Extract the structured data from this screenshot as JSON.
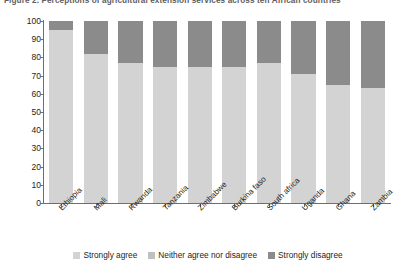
{
  "caption": "Figure 2.  Perceptions of agricultural extension services across ten African countries",
  "chart_data": {
    "type": "bar",
    "subtype": "stacked-percentage",
    "title": "",
    "xlabel": "",
    "ylabel": "Percent of respondents",
    "ylim": [
      0,
      100
    ],
    "ytick_step": 10,
    "yticks": [
      0,
      10,
      20,
      30,
      40,
      50,
      60,
      70,
      80,
      90,
      100
    ],
    "grid": false,
    "legend_position": "bottom",
    "categories": [
      "Ethiopia",
      "Mali",
      "Rwanda",
      "Tanzania",
      "Zimbabwe",
      "Burkina faso",
      "South africa",
      "Uganda",
      "Ghana",
      "Zambia"
    ],
    "series": [
      {
        "name": "Strongly agree",
        "color": "#d3d3d3",
        "values": [
          95,
          82,
          77,
          75,
          75,
          75,
          77,
          71,
          65,
          63
        ]
      },
      {
        "name": "Neither agree nor disagree",
        "color": "#c0c0c0",
        "values": [
          0,
          0,
          0,
          0,
          0,
          0,
          0,
          0,
          0,
          0
        ]
      },
      {
        "name": "Strongly disagree",
        "color": "#8b8b8b",
        "values": [
          5,
          18,
          23,
          25,
          25,
          25,
          23,
          29,
          35,
          37
        ]
      }
    ]
  },
  "axis": {
    "y_title": "Percent of respondents"
  },
  "legend": {
    "items": [
      {
        "label": "Strongly agree",
        "color": "#d3d3d3"
      },
      {
        "label": "Neither agree nor disagree",
        "color": "#c0c0c0"
      },
      {
        "label": "Strongly disagree",
        "color": "#8b8b8b"
      }
    ]
  }
}
